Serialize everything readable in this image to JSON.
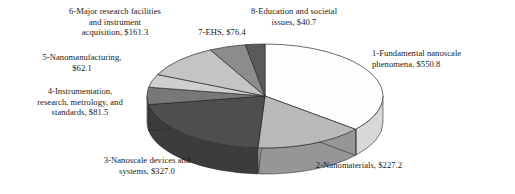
{
  "chart_data": {
    "type": "pie",
    "title": "",
    "subtitle": "",
    "xlabel": "",
    "ylabel": "",
    "units": "$ millions",
    "total": 1527.0,
    "legend_position": "none-labels-outside",
    "grid": false,
    "three_d": true,
    "start_angle_deg": -90,
    "direction": "clockwise",
    "categories": [
      "1-Fundamental nanoscale phenomena",
      "2-Nanomaterials",
      "3-Nanoscale devices and systems",
      "4-Instrumentation, research, metrology, and standards",
      "5-Nanomanufacturing",
      "6-Major research facilities and instrument acquisition",
      "7-EHS",
      "8-Education and societal issues"
    ],
    "values": [
      550.8,
      227.2,
      327.0,
      81.5,
      62.1,
      161.3,
      76.4,
      40.7
    ],
    "percents": [
      36.07,
      14.88,
      21.41,
      5.34,
      4.07,
      10.56,
      5.0,
      2.66
    ],
    "colors": [
      "#fdfdfd",
      "#b9b9b9",
      "#4e4e4e",
      "#787878",
      "#cfcfcf",
      "#c4c4c4",
      "#8c8c8c",
      "#5a5a5a"
    ],
    "side_colors": [
      "#d8d8d8",
      "#969696",
      "#3c3c3c",
      "#5e5e5e",
      "#a8a8a8",
      "#9e9e9e",
      "#6e6e6e",
      "#474747"
    ],
    "slices": [
      {
        "id": 1,
        "name": "Fundamental nanoscale phenomena",
        "value": 550.8,
        "percent": 36.07,
        "color": "#fdfdfd"
      },
      {
        "id": 2,
        "name": "Nanomaterials",
        "value": 227.2,
        "percent": 14.88,
        "color": "#b9b9b9"
      },
      {
        "id": 3,
        "name": "Nanoscale devices and systems",
        "value": 327.0,
        "percent": 21.41,
        "color": "#4e4e4e"
      },
      {
        "id": 4,
        "name": "Instrumentation, research, metrology, and standards",
        "value": 81.5,
        "percent": 5.34,
        "color": "#787878"
      },
      {
        "id": 5,
        "name": "Nanomanufacturing",
        "value": 62.1,
        "percent": 4.07,
        "color": "#cfcfcf"
      },
      {
        "id": 6,
        "name": "Major research facilities and instrument acquisition",
        "value": 161.3,
        "percent": 10.56,
        "color": "#c4c4c4"
      },
      {
        "id": 7,
        "name": "EHS",
        "value": 76.4,
        "percent": 5.0,
        "color": "#8c8c8c"
      },
      {
        "id": 8,
        "name": "Education and societal issues",
        "value": 40.7,
        "percent": 2.66,
        "color": "#5a5a5a"
      }
    ]
  },
  "labels": {
    "slice1": "1-Fundamental nanoscale\nphenomena, $550.8",
    "slice2": "2-Nanomaterials, $227.2",
    "slice3": "3-Nanoscale devices and\nsystems, $327.0",
    "slice4": "4-Instrumentation,\nresearch, metrology, and\nstandards, $81.5",
    "slice5": "5-Nanomanufacturing,\n$62.1",
    "slice6": "6-Major research facilities\nand instrument\nacquisition, $161.3",
    "slice7": "7-EHS, $76.4",
    "slice8": "8-Education and societal\nissues, $40.7"
  }
}
